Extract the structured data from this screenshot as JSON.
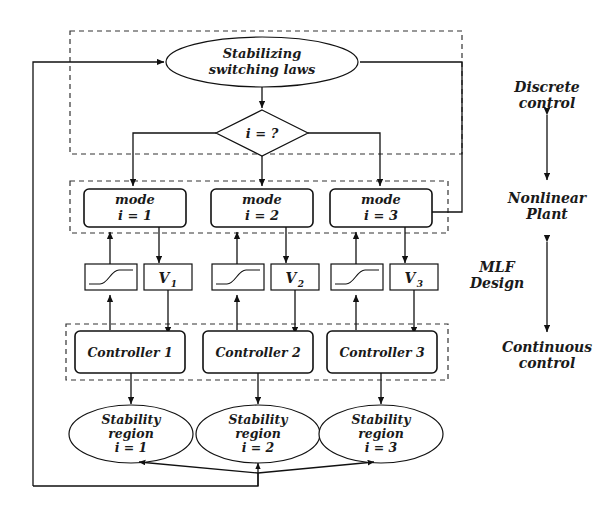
{
  "diagram": {
    "title_nodes": {
      "switching_laws_line1": "Stabilizing",
      "switching_laws_line2": "switching laws",
      "decision": "i = ?"
    },
    "modes": [
      {
        "label_line1": "mode",
        "label_line2": "i = 1"
      },
      {
        "label_line1": "mode",
        "label_line2": "i = 2"
      },
      {
        "label_line1": "mode",
        "label_line2": "i = 3"
      }
    ],
    "lyapunov": [
      {
        "base": "V",
        "sub": "1",
        "icon": "sigmoid-curve-icon"
      },
      {
        "base": "V",
        "sub": "2",
        "icon": "sigmoid-curve-icon"
      },
      {
        "base": "V",
        "sub": "3",
        "icon": "sigmoid-curve-icon"
      }
    ],
    "controllers": [
      {
        "label": "Controller 1"
      },
      {
        "label": "Controller 2"
      },
      {
        "label": "Controller 3"
      }
    ],
    "stability_regions": [
      {
        "line1": "Stability",
        "line2": "region",
        "line3": "i = 1"
      },
      {
        "line1": "Stability",
        "line2": "region",
        "line3": "i = 2"
      },
      {
        "line1": "Stability",
        "line2": "region",
        "line3": "i = 3"
      }
    ],
    "side_labels": [
      {
        "line1": "Discrete",
        "line2": "control"
      },
      {
        "line1": "Nonlinear",
        "line2": "Plant"
      },
      {
        "line1": "MLF",
        "line2": "Design"
      },
      {
        "line1": "Continuous",
        "line2": "control"
      }
    ],
    "colors": {
      "stroke": "#111111",
      "dashed_stroke": "#333333",
      "background": "#ffffff",
      "text": "#1a1a1a"
    }
  }
}
